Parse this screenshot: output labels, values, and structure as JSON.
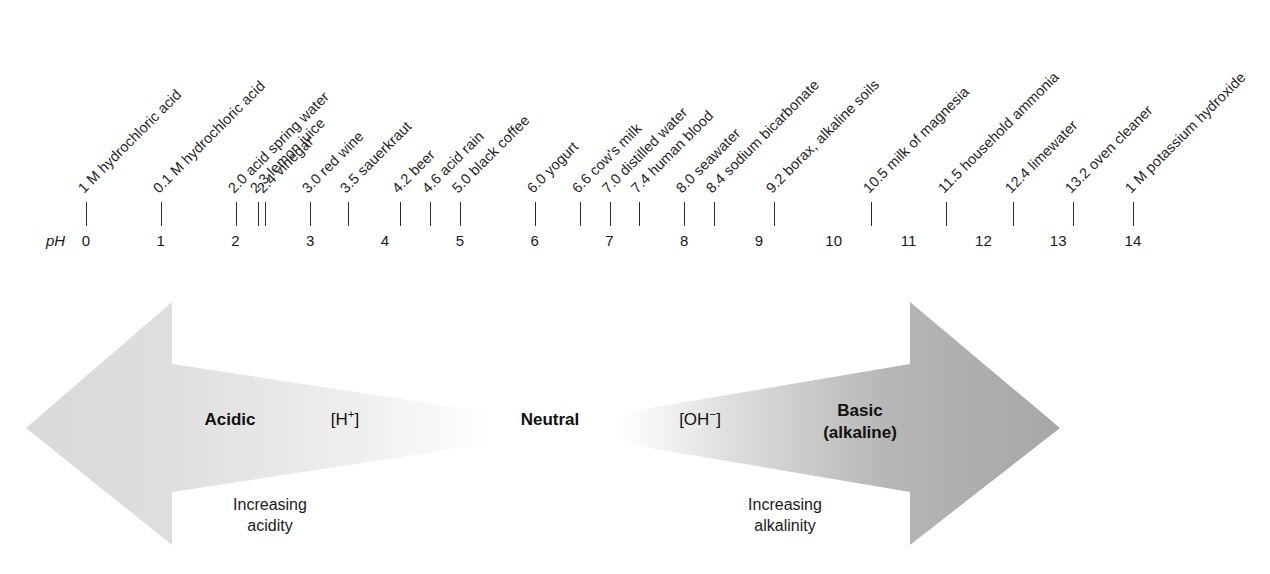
{
  "axis": {
    "name": "pH",
    "ph_label": "pH",
    "numbers": [
      "0",
      "1",
      "2",
      "3",
      "4",
      "5",
      "6",
      "7",
      "8",
      "9",
      "10",
      "11",
      "12",
      "13",
      "14"
    ],
    "range": [
      0,
      14
    ]
  },
  "substances": [
    {
      "ph": 0.0,
      "label": "1 M hydrochloric acid"
    },
    {
      "ph": 1.0,
      "label": "0.1 M hydrochloric acid"
    },
    {
      "ph": 2.0,
      "label": "2.0 acid spring water"
    },
    {
      "ph": 2.3,
      "label": "2.3 lemon juice"
    },
    {
      "ph": 2.4,
      "label": "2.4 vinegar"
    },
    {
      "ph": 3.0,
      "label": "3.0 red wine"
    },
    {
      "ph": 3.5,
      "label": "3.5 sauerkraut"
    },
    {
      "ph": 4.2,
      "label": "4.2 beer"
    },
    {
      "ph": 4.6,
      "label": "4.6 acid rain"
    },
    {
      "ph": 5.0,
      "label": "5.0 black coffee"
    },
    {
      "ph": 6.0,
      "label": "6.0 yogurt"
    },
    {
      "ph": 6.6,
      "label": "6.6 cow's milk"
    },
    {
      "ph": 7.0,
      "label": "7.0 distilled water"
    },
    {
      "ph": 7.4,
      "label": "7.4 human blood"
    },
    {
      "ph": 8.0,
      "label": "8.0 seawater"
    },
    {
      "ph": 8.4,
      "label": "8.4 sodium bicarbonate"
    },
    {
      "ph": 9.2,
      "label": "9.2 borax, alkaline soils"
    },
    {
      "ph": 10.5,
      "label": "10.5 milk of magnesia"
    },
    {
      "ph": 11.5,
      "label": "11.5 household ammonia"
    },
    {
      "ph": 12.4,
      "label": "12.4 limewater"
    },
    {
      "ph": 13.2,
      "label": "13.2 oven cleaner"
    },
    {
      "ph": 14.0,
      "label": "1 M potassium hydroxide"
    }
  ],
  "arrow": {
    "acidic_label": "Acidic",
    "hydrogen_ion_label": "[H⁺]",
    "neutral_label": "Neutral",
    "hydroxide_ion_label": "[OH⁻]",
    "basic_label_line1": "Basic",
    "basic_label_line2": "(alkaline)",
    "caption_left_line1": "Increasing",
    "caption_left_line2": "acidity",
    "caption_right_line1": "Increasing",
    "caption_right_line2": "alkalinity",
    "colors": {
      "acidic_fill": "#dcdcdc",
      "basic_fill": "#a9a9a9",
      "neutral_fill": "#ffffff"
    }
  },
  "chart_data": {
    "type": "scatter",
    "xlabel": "pH",
    "ylabel": "",
    "xlim": [
      0,
      14
    ],
    "grid": false,
    "legend": "none",
    "categories": [
      "1 M hydrochloric acid",
      "0.1 M hydrochloric acid",
      "2.0 acid spring water",
      "2.3 lemon juice",
      "2.4 vinegar",
      "3.0 red wine",
      "3.5 sauerkraut",
      "4.2 beer",
      "4.6 acid rain",
      "5.0 black coffee",
      "6.0 yogurt",
      "6.6 cow's milk",
      "7.0 distilled water",
      "7.4 human blood",
      "8.0 seawater",
      "8.4 sodium bicarbonate",
      "9.2 borax, alkaline soils",
      "10.5 milk of magnesia",
      "11.5 household ammonia",
      "12.4 limewater",
      "13.2 oven cleaner",
      "1 M potassium hydroxide"
    ],
    "values": [
      0.0,
      1.0,
      2.0,
      2.3,
      2.4,
      3.0,
      3.5,
      4.2,
      4.6,
      5.0,
      6.0,
      6.6,
      7.0,
      7.4,
      8.0,
      8.4,
      9.2,
      10.5,
      11.5,
      12.4,
      13.2,
      14.0
    ],
    "tick_labels": [
      "0",
      "1",
      "2",
      "3",
      "4",
      "5",
      "6",
      "7",
      "8",
      "9",
      "10",
      "11",
      "12",
      "13",
      "14"
    ],
    "annotations": [
      "Acidic",
      "[H+]",
      "Neutral",
      "[OH-]",
      "Basic (alkaline)",
      "Increasing acidity",
      "Increasing alkalinity"
    ]
  }
}
